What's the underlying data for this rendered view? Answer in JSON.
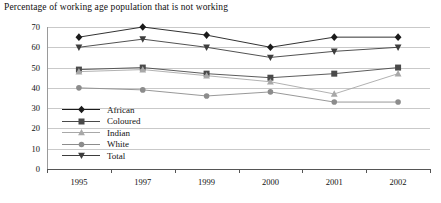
{
  "chart_data": {
    "type": "line",
    "title": "Percentage of working age population that is not working",
    "xlabel": "",
    "ylabel": "",
    "categories": [
      "1995",
      "1997",
      "1999",
      "2000",
      "2001",
      "2002"
    ],
    "ylim": [
      0,
      70
    ],
    "yticks": [
      0,
      10,
      20,
      30,
      40,
      50,
      60,
      70
    ],
    "grid": true,
    "legend_position": "inside-left",
    "series": [
      {
        "name": "African",
        "marker": "diamond",
        "color": "#1b1b1b",
        "values": [
          65,
          70,
          66,
          60,
          65,
          65
        ]
      },
      {
        "name": "Coloured",
        "marker": "square",
        "color": "#4a4a4a",
        "values": [
          49,
          50,
          47,
          45,
          47,
          50
        ]
      },
      {
        "name": "Indian",
        "marker": "triangle-up",
        "color": "#a8a8a8",
        "values": [
          48,
          49,
          46,
          43,
          37,
          47
        ]
      },
      {
        "name": "White",
        "marker": "circle",
        "color": "#8c8c8c",
        "values": [
          40,
          39,
          36,
          38,
          33,
          33
        ]
      },
      {
        "name": "Total",
        "marker": "triangle-down",
        "color": "#3d3d3d",
        "values": [
          60,
          64,
          60,
          55,
          58,
          60
        ]
      }
    ]
  },
  "legend": {
    "items": [
      {
        "label": "African"
      },
      {
        "label": "Coloured"
      },
      {
        "label": "Indian"
      },
      {
        "label": "White"
      },
      {
        "label": "Total"
      }
    ]
  }
}
